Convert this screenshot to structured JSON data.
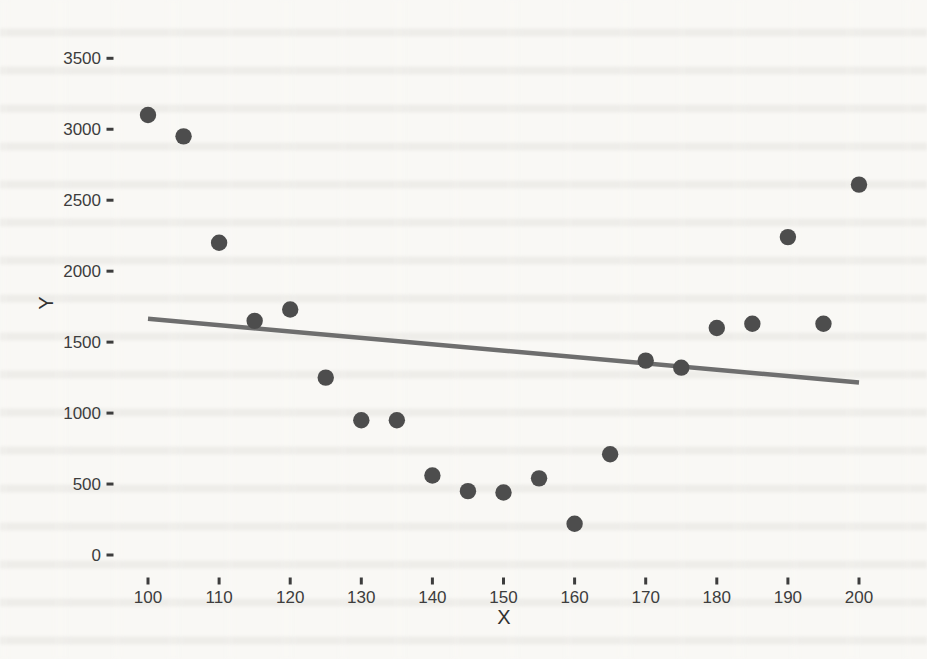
{
  "page": {
    "background_color": "#f9f8f5",
    "ink_color": "#3d3d3d"
  },
  "chart_data": {
    "type": "scatter",
    "title": "",
    "xlabel": "X",
    "ylabel": "Y",
    "x_ticks": [
      100,
      110,
      120,
      130,
      140,
      150,
      160,
      170,
      180,
      190,
      200
    ],
    "y_ticks": [
      0,
      500,
      1000,
      1500,
      2000,
      2500,
      3000,
      3500
    ],
    "xlim": [
      95,
      205
    ],
    "ylim": [
      0,
      3500
    ],
    "grid": false,
    "legend": false,
    "point_color": "#4d4d4d",
    "trend_color": "#6e6e6e",
    "points": [
      {
        "x": 100,
        "y": 3100
      },
      {
        "x": 105,
        "y": 2950
      },
      {
        "x": 110,
        "y": 2200
      },
      {
        "x": 115,
        "y": 1650
      },
      {
        "x": 120,
        "y": 1730
      },
      {
        "x": 125,
        "y": 1250
      },
      {
        "x": 130,
        "y": 950
      },
      {
        "x": 135,
        "y": 950
      },
      {
        "x": 140,
        "y": 560
      },
      {
        "x": 145,
        "y": 450
      },
      {
        "x": 150,
        "y": 440
      },
      {
        "x": 155,
        "y": 540
      },
      {
        "x": 160,
        "y": 220
      },
      {
        "x": 165,
        "y": 710
      },
      {
        "x": 170,
        "y": 1370
      },
      {
        "x": 175,
        "y": 1320
      },
      {
        "x": 180,
        "y": 1600
      },
      {
        "x": 185,
        "y": 1630
      },
      {
        "x": 190,
        "y": 2240
      },
      {
        "x": 195,
        "y": 1630
      },
      {
        "x": 200,
        "y": 2610
      }
    ],
    "trend_line": {
      "x1": 100,
      "y1": 1665,
      "x2": 200,
      "y2": 1215
    }
  }
}
